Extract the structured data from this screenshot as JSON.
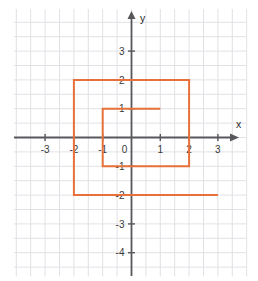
{
  "figure": {
    "title": "",
    "axis_labels": {
      "x": "x",
      "y": "y"
    },
    "origin_label": "0"
  },
  "chart_data": {
    "type": "line",
    "title": "",
    "xlabel": "x",
    "ylabel": "y",
    "xlim": [
      -4.05,
      4.0
    ],
    "ylim": [
      -4.45,
      4.45
    ],
    "grid": true,
    "grid_step": 0.5,
    "legend": "none",
    "xticks": [
      -3,
      -2,
      -1,
      0,
      1,
      2,
      3
    ],
    "xtick_labels": [
      "-3",
      "-2",
      "-1",
      "0",
      "1",
      "2",
      "3"
    ],
    "yticks": [
      3,
      2,
      1,
      -1,
      -2,
      -3,
      -4
    ],
    "ytick_labels": [
      "3",
      "2",
      "1",
      "-1",
      "-2",
      "-3",
      "-4"
    ],
    "series": [
      {
        "name": "spiral-path",
        "color": "#E8703A",
        "linewidth": 2,
        "points": [
          [
            1,
            1
          ],
          [
            -1,
            1
          ],
          [
            -1,
            -1
          ],
          [
            2,
            -1
          ],
          [
            2,
            2
          ],
          [
            -2,
            2
          ],
          [
            -2,
            -2
          ],
          [
            3,
            -2
          ]
        ]
      }
    ]
  },
  "ticks": {
    "x": [
      {
        "value": -3,
        "label": "-3"
      },
      {
        "value": -2,
        "label": "-2"
      },
      {
        "value": -1,
        "label": "-1"
      },
      {
        "value": 1,
        "label": "1"
      },
      {
        "value": 2,
        "label": "2"
      },
      {
        "value": 3,
        "label": "3"
      }
    ],
    "y": [
      {
        "value": 3,
        "label": "3"
      },
      {
        "value": 2,
        "label": "2"
      },
      {
        "value": 1,
        "label": "1"
      },
      {
        "value": -1,
        "label": "-1"
      },
      {
        "value": -2,
        "label": "-2"
      },
      {
        "value": -3,
        "label": "-3"
      },
      {
        "value": -4,
        "label": "-4"
      }
    ]
  },
  "colors": {
    "grid": "#e2e2e6",
    "axis": "#58585c",
    "curve": "#E8703A",
    "text": "#3a3a3a",
    "background": "#ffffff"
  }
}
